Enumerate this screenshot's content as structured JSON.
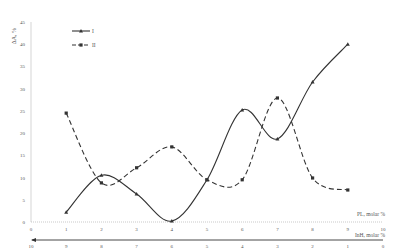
{
  "chart_data": {
    "type": "line",
    "title": "",
    "ylabel": "ΔA, %",
    "xlabel": "PL, molar %",
    "xlabel_secondary": "InH, molar %",
    "ylim": [
      0,
      45
    ],
    "xlim": [
      0,
      10
    ],
    "yticks": [
      0,
      5,
      10,
      15,
      20,
      25,
      30,
      35,
      40,
      45
    ],
    "xticks": [
      0,
      1,
      2,
      3,
      4,
      5,
      6,
      7,
      8,
      9,
      10
    ],
    "xticks_secondary": [
      10,
      9,
      8,
      7,
      6,
      5,
      4,
      3,
      2,
      1,
      0
    ],
    "grid": false,
    "legend_position": "top-left",
    "x": [
      1,
      2,
      3,
      4,
      5,
      6,
      7,
      8,
      9
    ],
    "series": [
      {
        "name": "I",
        "style": "solid",
        "marker": "triangle",
        "values": [
          2.2,
          10.5,
          6.3,
          0.2,
          9.5,
          25.2,
          18.7,
          31.5,
          40.0
        ]
      },
      {
        "name": "II",
        "style": "dashed",
        "marker": "square",
        "values": [
          24.5,
          8.8,
          12.2,
          16.9,
          9.5,
          9.5,
          27.9,
          9.9,
          7.2
        ]
      }
    ]
  }
}
